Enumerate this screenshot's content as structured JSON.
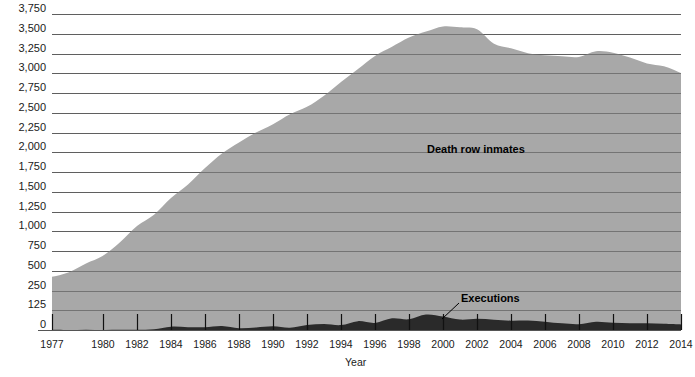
{
  "chart_data": {
    "type": "area",
    "title": "",
    "xlabel": "Year",
    "ylabel": "",
    "grid": true,
    "legend_position": "inline-annotation",
    "x": [
      1977,
      1978,
      1979,
      1980,
      1981,
      1982,
      1983,
      1984,
      1985,
      1986,
      1987,
      1988,
      1989,
      1990,
      1991,
      1992,
      1993,
      1994,
      1995,
      1996,
      1997,
      1998,
      1999,
      2000,
      2001,
      2002,
      2003,
      2004,
      2005,
      2006,
      2007,
      2008,
      2009,
      2010,
      2011,
      2012,
      2013,
      2014
    ],
    "xlim": [
      1977,
      2014
    ],
    "ylim": [
      0,
      3750
    ],
    "yticks": [
      0,
      125,
      250,
      500,
      750,
      1000,
      1250,
      1500,
      1750,
      2000,
      2250,
      2500,
      2750,
      3000,
      3250,
      3500,
      3750
    ],
    "ytick_labels": [
      "0",
      "125",
      "250",
      "500",
      "750",
      "1,000",
      "1,250",
      "1,500",
      "1,750",
      "2,000",
      "2,250",
      "2,500",
      "2,750",
      "3,000",
      "3,250",
      "3,500",
      "3,750"
    ],
    "xticks": [
      1977,
      1980,
      1982,
      1984,
      1986,
      1988,
      1990,
      1992,
      1994,
      1996,
      1998,
      2000,
      2002,
      2004,
      2006,
      2008,
      2010,
      2012,
      2014
    ],
    "xtick_labels": [
      "1977",
      "1980",
      "1982",
      "1984",
      "1986",
      "1988",
      "1990",
      "1992",
      "1994",
      "1996",
      "1998",
      "2000",
      "2002",
      "2004",
      "2006",
      "2008",
      "2010",
      "2012",
      "2014"
    ],
    "series": [
      {
        "name": "Death row inmates",
        "color": "#a8a8a8",
        "values": [
          423,
          482,
          593,
          691,
          860,
          1066,
          1209,
          1420,
          1591,
          1800,
          1984,
          2124,
          2250,
          2356,
          2482,
          2575,
          2716,
          2890,
          3054,
          3219,
          3335,
          3452,
          3527,
          3593,
          3581,
          3557,
          3374,
          3315,
          3254,
          3228,
          3215,
          3207,
          3279,
          3261,
          3199,
          3125,
          3088,
          3002
        ]
      },
      {
        "name": "Executions",
        "color": "#2a2a2a",
        "values": [
          1,
          0,
          2,
          0,
          1,
          2,
          5,
          21,
          18,
          18,
          25,
          11,
          16,
          23,
          14,
          31,
          38,
          31,
          56,
          45,
          74,
          68,
          98,
          85,
          66,
          71,
          65,
          59,
          60,
          53,
          42,
          37,
          52,
          46,
          43,
          43,
          39,
          35
        ]
      }
    ],
    "annotations": [
      {
        "text": "Death row inmates",
        "x": 1998,
        "y": 2100
      },
      {
        "text": "Executions",
        "x": 2000,
        "y": 330,
        "leader": true
      }
    ]
  },
  "axis": {
    "x_axis_title": "Year"
  },
  "colors": {
    "death_row_fill": "#a8a8a8",
    "executions_fill": "#2a2a2a",
    "gridline": "#6e6e6e",
    "text": "#1a1a1a",
    "background": "#ffffff"
  }
}
